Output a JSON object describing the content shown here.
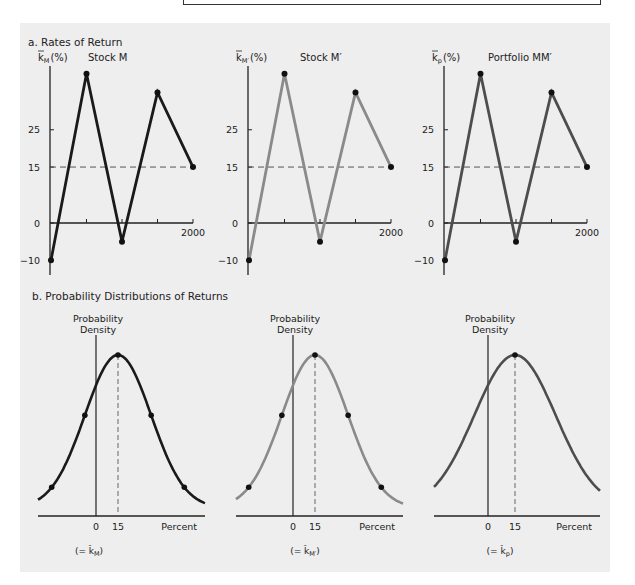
{
  "chart_data": [
    {
      "type": "line",
      "panel": "a",
      "section_title": "a. Rates of Return",
      "title": "Stock M",
      "ylabel_base": "k",
      "ylabel_sub": "M",
      "ylabel_unit": "(%)",
      "color": "#1a1a1a",
      "x": [
        1996,
        1997,
        1998,
        1999,
        2000
      ],
      "x_tick_labels": [
        "",
        "",
        "",
        "",
        "2000"
      ],
      "values": [
        -10,
        40,
        -5,
        35,
        15
      ],
      "y_ticks": [
        -10,
        0,
        15,
        25
      ],
      "ylim": [
        -14,
        44
      ],
      "mean_line": 15,
      "marked_points": [
        0,
        1,
        2,
        3,
        4
      ]
    },
    {
      "type": "line",
      "panel": "a",
      "title": "Stock M′",
      "ylabel_base": "k",
      "ylabel_sub": "M′",
      "ylabel_unit": "(%)",
      "color": "#8a8a8a",
      "x": [
        1996,
        1997,
        1998,
        1999,
        2000
      ],
      "x_tick_labels": [
        "",
        "",
        "",
        "",
        "2000"
      ],
      "values": [
        -10,
        40,
        -5,
        35,
        15
      ],
      "y_ticks": [
        -10,
        0,
        15,
        25
      ],
      "ylim": [
        -14,
        44
      ],
      "mean_line": 15,
      "marked_points": [
        0,
        1,
        2,
        3,
        4
      ]
    },
    {
      "type": "line",
      "panel": "a",
      "title": "Portfolio MM′",
      "ylabel_base": "k",
      "ylabel_sub": "p",
      "ylabel_unit": "(%)",
      "color": "#4d4d4d",
      "x": [
        1996,
        1997,
        1998,
        1999,
        2000
      ],
      "x_tick_labels": [
        "",
        "",
        "",
        "",
        "2000"
      ],
      "values": [
        -10,
        40,
        -5,
        35,
        15
      ],
      "y_ticks": [
        -10,
        0,
        15,
        25
      ],
      "ylim": [
        -14,
        44
      ],
      "mean_line": 15,
      "marked_points": [
        0,
        1,
        2,
        3,
        4
      ]
    },
    {
      "type": "line",
      "panel": "b",
      "section_title": "b. Probability Distributions of Returns",
      "ylabel": [
        "Probability",
        "Density"
      ],
      "xlabel": "Percent",
      "x_tick_labels": [
        "0",
        "15"
      ],
      "mean": 15,
      "std": 22.6,
      "expected_label": "(= k̂",
      "expected_sub": "M",
      "color": "#1a1a1a",
      "marked_sigmas": [
        -2,
        -1,
        0,
        1,
        2
      ]
    },
    {
      "type": "line",
      "panel": "b",
      "ylabel": [
        "Probability",
        "Density"
      ],
      "xlabel": "Percent",
      "x_tick_labels": [
        "0",
        "15"
      ],
      "mean": 15,
      "std": 22.6,
      "expected_label": "(= k̂",
      "expected_sub": "M′",
      "color": "#8a8a8a",
      "marked_sigmas": [
        -2,
        -1,
        0,
        1,
        2
      ]
    },
    {
      "type": "line",
      "panel": "b",
      "ylabel": [
        "Probability",
        "Density"
      ],
      "xlabel": "Percent",
      "x_tick_labels": [
        "0",
        "15"
      ],
      "mean": 15,
      "std": 22.6,
      "expected_label": "(= k̂",
      "expected_sub": "p",
      "color": "#4d4d4d",
      "marked_sigmas": [
        0
      ]
    }
  ]
}
